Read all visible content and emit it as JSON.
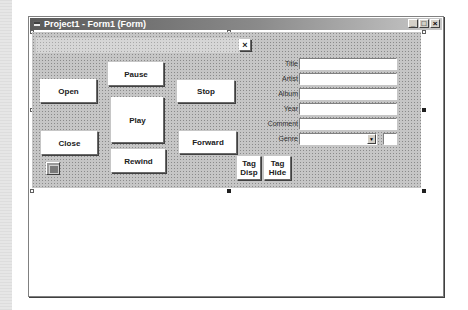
{
  "window": {
    "title": "Project1 - Form1 (Form)",
    "controls": {
      "minimize": "_",
      "maximize": "□",
      "close": "×"
    }
  },
  "form": {
    "close_x_label": "×",
    "buttons": {
      "open": "Open",
      "close": "Close",
      "pause": "Pause",
      "play": "Play",
      "rewind": "Rewind",
      "stop": "Stop",
      "forward": "Forward",
      "tag_disp": "Tag\nDisp",
      "tag_hide": "Tag\nHide"
    },
    "fields": [
      {
        "label": "Title",
        "value": ""
      },
      {
        "label": "Artist",
        "value": ""
      },
      {
        "label": "Album",
        "value": ""
      },
      {
        "label": "Year",
        "value": ""
      },
      {
        "label": "Comment",
        "value": ""
      },
      {
        "label": "Genre",
        "value": ""
      }
    ],
    "genre_arrow": "▼",
    "genre_extra_value": ""
  },
  "icons": {
    "title_icon": "form-icon",
    "picture_control": "picture-icon"
  }
}
